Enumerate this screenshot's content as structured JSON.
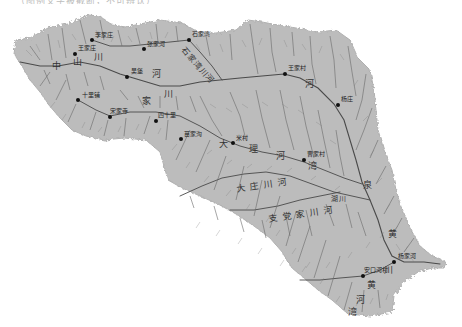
{
  "caption": {
    "text": "（图例文字被截断，不可辨认）"
  },
  "map": {
    "type": "watershed-drainage-map",
    "basin_fill_color": "#bcbcbc",
    "stream_color": "#555555",
    "background_color": "#ffffff",
    "settlement_dot_color": "#111111",
    "settlements": [
      {
        "name": "李家庄",
        "x": 92,
        "y": 40
      },
      {
        "name": "王家庄",
        "x": 75,
        "y": 54
      },
      {
        "name": "张家河",
        "x": 144,
        "y": 49
      },
      {
        "name": "石家湾",
        "x": 189,
        "y": 40
      },
      {
        "name": "吴堡",
        "x": 127,
        "y": 77
      },
      {
        "name": "十里铺",
        "x": 78,
        "y": 100
      },
      {
        "name": "宋家寺",
        "x": 110,
        "y": 117
      },
      {
        "name": "四十里",
        "x": 156,
        "y": 121
      },
      {
        "name": "苗家沟",
        "x": 181,
        "y": 139
      },
      {
        "name": "王家村",
        "x": 285,
        "y": 74
      },
      {
        "name": "杨庄",
        "x": 338,
        "y": 105
      },
      {
        "name": "米村",
        "x": 233,
        "y": 143
      },
      {
        "name": "曹家村",
        "x": 304,
        "y": 160
      },
      {
        "name": "杨家河",
        "x": 394,
        "y": 262
      },
      {
        "name": "安口河村",
        "x": 363,
        "y": 276
      }
    ],
    "river_labels": [
      {
        "text": "中",
        "x": 52,
        "y": 66
      },
      {
        "text": "山",
        "x": 73,
        "y": 62
      },
      {
        "text": "川",
        "x": 94,
        "y": 57
      },
      {
        "text": "河",
        "x": 152,
        "y": 72
      },
      {
        "text": "家",
        "x": 142,
        "y": 100
      },
      {
        "text": "川",
        "x": 164,
        "y": 93
      },
      {
        "text": "石家湾川河",
        "x": 186,
        "y": 46,
        "rotate": 50
      },
      {
        "text": "河",
        "x": 305,
        "y": 84
      },
      {
        "text": "大",
        "x": 221,
        "y": 142
      },
      {
        "text": "理",
        "x": 249,
        "y": 148
      },
      {
        "text": "河",
        "x": 276,
        "y": 155
      },
      {
        "text": "湾",
        "x": 308,
        "y": 164
      },
      {
        "text": "大庄川河",
        "x": 240,
        "y": 183
      },
      {
        "text": "支党家川河",
        "x": 270,
        "y": 214
      },
      {
        "text": "湖川",
        "x": 335,
        "y": 199
      },
      {
        "text": "泉",
        "x": 363,
        "y": 183
      },
      {
        "text": "黄",
        "x": 390,
        "y": 232
      },
      {
        "text": "川",
        "x": 389,
        "y": 270
      },
      {
        "text": "河",
        "x": 357,
        "y": 298
      },
      {
        "text": "黄",
        "x": 368,
        "y": 283
      },
      {
        "text": "湾",
        "x": 349,
        "y": 311
      }
    ]
  }
}
